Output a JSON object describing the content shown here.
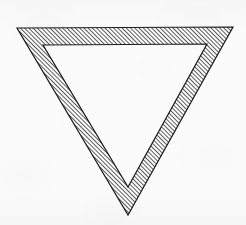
{
  "figure": {
    "kind": "geometric-shape",
    "shape_name": "downward-pointing-triangle-outline",
    "caption": ""
  },
  "canvas": {
    "width": 246,
    "height": 225,
    "background_color": "#fbfbfb",
    "paper_texture": "light-grey-speckled"
  },
  "shape": {
    "orientation": "point-down",
    "stroke_color": "#1c1c1c",
    "stroke_width": 1.2,
    "band_fill": "diagonal-hatch",
    "band_width_px": 22,
    "outer_vertices": [
      {
        "label": "top-left",
        "x": 17,
        "y": 28
      },
      {
        "label": "top-right",
        "x": 233,
        "y": 27
      },
      {
        "label": "bottom",
        "x": 128,
        "y": 215
      }
    ],
    "inner_vertices": [
      {
        "label": "top-left",
        "x": 43,
        "y": 45
      },
      {
        "label": "top-right",
        "x": 207,
        "y": 44
      },
      {
        "label": "bottom",
        "x": 128,
        "y": 187
      }
    ],
    "outer_path": "17,28 233,27 128,215",
    "inner_path": "43,45 207,44 128,187"
  },
  "hatch": {
    "pattern_name": "diagonal-hatch-45",
    "direction": "forward-slash",
    "angle_degrees": 45,
    "period_px": 3,
    "line_width_px": 1.5,
    "line_color": "#222222",
    "gap_color": "#ffffff"
  }
}
